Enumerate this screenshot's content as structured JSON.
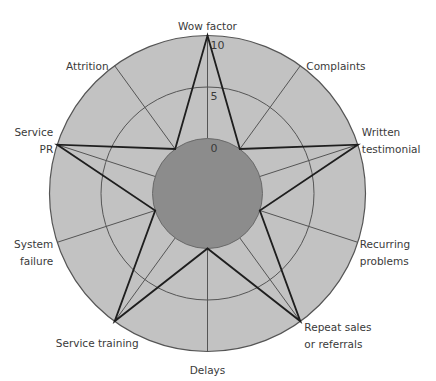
{
  "chart_data": {
    "type": "radar",
    "title": "",
    "axes": [
      {
        "label": [
          "Wow factor"
        ],
        "value": 10
      },
      {
        "label": [
          "Complaints"
        ],
        "value": 0
      },
      {
        "label": [
          "Written",
          "testimonial"
        ],
        "value": 10
      },
      {
        "label": [
          "Recurring",
          "problems"
        ],
        "value": 0
      },
      {
        "label": [
          "Repeat sales",
          "or referrals"
        ],
        "value": 10
      },
      {
        "label": [
          "Delays"
        ],
        "value": 0
      },
      {
        "label": [
          "Service training"
        ],
        "value": 10
      },
      {
        "label": [
          "System",
          "failure"
        ],
        "value": 0
      },
      {
        "label": [
          "Service",
          "PR"
        ],
        "value": 10
      },
      {
        "label": [
          "Attrition"
        ],
        "value": 0
      }
    ],
    "scale": {
      "min": 0,
      "max": 10,
      "ticks": [
        0,
        5,
        10
      ],
      "tick_labels": [
        "0",
        "5",
        "10"
      ]
    },
    "series": [
      {
        "name": "Profile",
        "values": [
          10,
          0,
          10,
          0,
          10,
          0,
          10,
          0,
          10,
          0
        ]
      }
    ],
    "grid": true,
    "legend": "none"
  },
  "colors": {
    "outer_fill": "#c2c2c2",
    "zero_disc_fill": "#8c8c8c",
    "grid_stroke": "#555555",
    "series_stroke": "#1e1e1e",
    "text": "#3a3a3a"
  }
}
